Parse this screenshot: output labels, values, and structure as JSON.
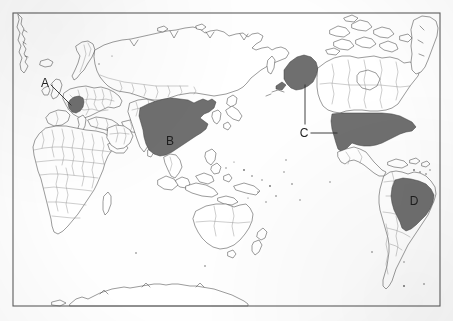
{
  "figure": {
    "kind": "world-map",
    "projection": "pacific-centered-equirectangular",
    "frame": {
      "x": 13,
      "y": 13,
      "width": 427,
      "height": 293
    },
    "background_color": "#fefefe",
    "coastline_color": "#4a4a4a",
    "country_border_color": "#8a8a8a",
    "highlight_fill_color": "#6f6f6f",
    "label_color": "#242424",
    "frame_color": "#5d5d5d"
  },
  "labels": [
    {
      "id": "A",
      "text": "A",
      "country": "Germany",
      "label_x": 45,
      "label_y": 87,
      "placement": "outside",
      "leader": [
        {
          "x1": 51,
          "y1": 85,
          "x2": 71,
          "y2": 105
        }
      ]
    },
    {
      "id": "B",
      "text": "B",
      "country": "China",
      "label_x": 170,
      "label_y": 145,
      "placement": "inside",
      "leader": []
    },
    {
      "id": "C",
      "text": "C",
      "country": "United States",
      "label_x": 299,
      "label_y": 137,
      "placement": "outside",
      "leader": [
        {
          "x1": 305,
          "y1": 124,
          "x2": 305,
          "y2": 88
        },
        {
          "x1": 305,
          "y1": 88,
          "x2": 306,
          "y2": 84
        },
        {
          "x1": 311,
          "y1": 133,
          "x2": 337,
          "y2": 133
        }
      ]
    },
    {
      "id": "D",
      "text": "D",
      "country": "Brazil",
      "label_x": 409,
      "label_y": 205,
      "placement": "inside",
      "leader": []
    }
  ],
  "highlighted_regions": [
    {
      "id": "A",
      "name": "Germany",
      "label": "A"
    },
    {
      "id": "B",
      "name": "China",
      "label": "B"
    },
    {
      "id": "C1",
      "name": "Alaska",
      "label": "C"
    },
    {
      "id": "C2",
      "name": "Contiguous United States",
      "label": "C"
    },
    {
      "id": "D",
      "name": "Brazil",
      "label": "D"
    }
  ],
  "landmasses": [
    "Greenland",
    "North America",
    "Canada",
    "Canadian Arctic Archipelago",
    "United States",
    "Alaska",
    "Mexico",
    "Central America",
    "Caribbean",
    "South America",
    "Brazil",
    "Europe",
    "Scandinavia",
    "Iceland",
    "Africa",
    "Madagascar",
    "Russia",
    "China",
    "India",
    "Arabia",
    "Southeast Asia",
    "Indonesia",
    "Philippines",
    "Japan",
    "Korea",
    "Australia",
    "New Zealand",
    "Papua New Guinea",
    "Antarctica"
  ]
}
